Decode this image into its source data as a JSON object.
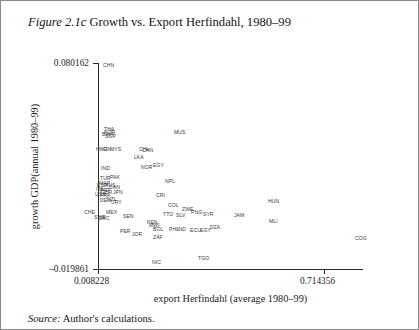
{
  "caption": {
    "figure_label": "Figure 2.1c",
    "title": "Growth vs. Export Herfindahl, 1980–99"
  },
  "source": {
    "label": "Source:",
    "text": "Author's calculations."
  },
  "chart_data": {
    "type": "scatter",
    "title": "Growth vs. Export Herfindahl, 1980–99",
    "xlabel": "export Herfindahl (average 1980–99)",
    "ylabel": "growth GDP(annual 1980–99)",
    "xlim": [
      0.008228,
      0.714356
    ],
    "ylim": [
      -0.019861,
      0.080162
    ],
    "xticks": [
      "0.008228",
      "0.714356"
    ],
    "yticks": [
      "0.080162",
      "-0.019861"
    ],
    "grid": false,
    "legend": "none",
    "point_label_field": "iso3 country code",
    "points": [
      {
        "label": "CHN",
        "x": 0.028,
        "y": 0.08
      },
      {
        "label": "THA",
        "x": 0.03,
        "y": 0.0545
      },
      {
        "label": "KOR",
        "x": 0.031,
        "y": 0.0535
      },
      {
        "label": "BWA",
        "x": 0.029,
        "y": 0.0522
      },
      {
        "label": "SGP",
        "x": 0.033,
        "y": 0.0512
      },
      {
        "label": "MUS",
        "x": 0.205,
        "y": 0.0545
      },
      {
        "label": "HKG",
        "x": 0.021,
        "y": 0.0455
      },
      {
        "label": "IDN",
        "x": 0.027,
        "y": 0.0452
      },
      {
        "label": "MYS",
        "x": 0.042,
        "y": 0.045
      },
      {
        "label": "CHL",
        "x": 0.13,
        "y": 0.0442
      },
      {
        "label": "CHN2",
        "x": 0.136,
        "y": 0.0438
      },
      {
        "label": "LKA",
        "x": 0.108,
        "y": 0.0405
      },
      {
        "label": "IND",
        "x": 0.026,
        "y": 0.0365
      },
      {
        "label": "NOR",
        "x": 0.13,
        "y": 0.0362
      },
      {
        "label": "EGY",
        "x": 0.15,
        "y": 0.0372
      },
      {
        "label": "PAK",
        "x": 0.057,
        "y": 0.0358
      },
      {
        "label": "TUR",
        "x": 0.024,
        "y": 0.034
      },
      {
        "label": "NPL",
        "x": 0.18,
        "y": 0.0318
      },
      {
        "label": "MAR",
        "x": 0.023,
        "y": 0.032
      },
      {
        "label": "AUS",
        "x": 0.036,
        "y": 0.0312
      },
      {
        "label": "ESP",
        "x": 0.02,
        "y": 0.0305
      },
      {
        "label": "CAN",
        "x": 0.041,
        "y": 0.0302
      },
      {
        "label": "ITA",
        "x": 0.019,
        "y": 0.0292
      },
      {
        "label": "PRT",
        "x": 0.022,
        "y": 0.0288
      },
      {
        "label": "GBR",
        "x": 0.026,
        "y": 0.0282
      },
      {
        "label": "JPN",
        "x": 0.05,
        "y": 0.0278
      },
      {
        "label": "USA",
        "x": 0.018,
        "y": 0.0272
      },
      {
        "label": "FRA",
        "x": 0.021,
        "y": 0.0268
      },
      {
        "label": "CRI",
        "x": 0.152,
        "y": 0.0268
      },
      {
        "label": "COL",
        "x": 0.168,
        "y": 0.0232
      },
      {
        "label": "NZL",
        "x": 0.04,
        "y": 0.0252
      },
      {
        "label": "DEU",
        "x": 0.024,
        "y": 0.0248
      },
      {
        "label": "URY",
        "x": 0.055,
        "y": 0.0238
      },
      {
        "label": "ZWE",
        "x": 0.192,
        "y": 0.0218
      },
      {
        "label": "CHE",
        "x": 0.012,
        "y": 0.0205
      },
      {
        "label": "MEX",
        "x": 0.048,
        "y": 0.0202
      },
      {
        "label": "TTO",
        "x": 0.16,
        "y": 0.0198
      },
      {
        "label": "SLV",
        "x": 0.176,
        "y": 0.0192
      },
      {
        "label": "PNG",
        "x": 0.206,
        "y": 0.0208
      },
      {
        "label": "SYR",
        "x": 0.222,
        "y": 0.02
      },
      {
        "label": "JAM",
        "x": 0.272,
        "y": 0.0192
      },
      {
        "label": "HUN",
        "x": 0.31,
        "y": 0.0262
      },
      {
        "label": "SEN",
        "x": 0.072,
        "y": 0.0192
      },
      {
        "label": "SWE",
        "x": 0.016,
        "y": 0.0188
      },
      {
        "label": "GRC",
        "x": 0.02,
        "y": 0.0185
      },
      {
        "label": "KEN",
        "x": 0.098,
        "y": 0.0162
      },
      {
        "label": "MWI",
        "x": 0.104,
        "y": 0.0172
      },
      {
        "label": "BOL",
        "x": 0.122,
        "y": 0.0152
      },
      {
        "label": "PHL",
        "x": 0.148,
        "y": 0.015
      },
      {
        "label": "IND2",
        "x": 0.158,
        "y": 0.0148
      },
      {
        "label": "ECU",
        "x": 0.186,
        "y": 0.0145
      },
      {
        "label": "DZA",
        "x": 0.214,
        "y": 0.0152
      },
      {
        "label": "MLI",
        "x": 0.312,
        "y": 0.0162
      },
      {
        "label": "PER",
        "x": 0.096,
        "y": 0.0125
      },
      {
        "label": "JOR",
        "x": 0.112,
        "y": 0.0115
      },
      {
        "label": "ZAF",
        "x": 0.142,
        "y": 0.0108
      },
      {
        "label": "COG",
        "x": 0.468,
        "y": 0.0118
      },
      {
        "label": "NIC",
        "x": 0.144,
        "y": -0.0128
      },
      {
        "label": "TGO",
        "x": 0.215,
        "y": -0.0108
      }
    ]
  },
  "plot_labels": [
    {
      "name": "CHN",
      "text": "CHN",
      "left": 102,
      "top": 62
    },
    {
      "name": "THA",
      "text": "THA",
      "left": 103,
      "top": 126
    },
    {
      "name": "KOR",
      "text": "KOR",
      "left": 103,
      "top": 129
    },
    {
      "name": "BWA",
      "text": "BWA",
      "left": 101,
      "top": 131
    },
    {
      "name": "SGP",
      "text": "SGP",
      "left": 104,
      "top": 133
    },
    {
      "name": "MUS",
      "text": "MUS",
      "left": 173,
      "top": 129
    },
    {
      "name": "HKG",
      "text": "HKG",
      "left": 95,
      "top": 146
    },
    {
      "name": "IDN",
      "text": "IDN",
      "left": 101,
      "top": 146
    },
    {
      "name": "MYS",
      "text": "MYS",
      "left": 109,
      "top": 146
    },
    {
      "name": "CHL",
      "text": "CHL",
      "left": 138,
      "top": 146
    },
    {
      "name": "CHN-b",
      "text": "CHN",
      "left": 141,
      "top": 147
    },
    {
      "name": "LKA",
      "text": "LKA",
      "left": 133,
      "top": 154
    },
    {
      "name": "IND",
      "text": "IND",
      "left": 100,
      "top": 165
    },
    {
      "name": "NOR",
      "text": "NOR",
      "left": 140,
      "top": 164
    },
    {
      "name": "EGY",
      "text": "EGY",
      "left": 152,
      "top": 162
    },
    {
      "name": "PAK",
      "text": "PAK",
      "left": 109,
      "top": 174
    },
    {
      "name": "TUR",
      "text": "TUR",
      "left": 99,
      "top": 175
    },
    {
      "name": "NPL",
      "text": "NPL",
      "left": 164,
      "top": 178
    },
    {
      "name": "MAR",
      "text": "MAR",
      "left": 98,
      "top": 180
    },
    {
      "name": "AUS",
      "text": "AUS",
      "left": 104,
      "top": 182
    },
    {
      "name": "ESP",
      "text": "ESP",
      "left": 96,
      "top": 182
    },
    {
      "name": "CAN",
      "text": "CAN",
      "left": 108,
      "top": 184
    },
    {
      "name": "ITA",
      "text": "ITA",
      "left": 95,
      "top": 186
    },
    {
      "name": "PRT",
      "text": "PRT",
      "left": 99,
      "top": 187
    },
    {
      "name": "GBR",
      "text": "GBR",
      "left": 100,
      "top": 189
    },
    {
      "name": "JPN",
      "text": "JPN",
      "left": 112,
      "top": 189
    },
    {
      "name": "USA",
      "text": "USA",
      "left": 94,
      "top": 191
    },
    {
      "name": "FRA",
      "text": "FRA",
      "left": 99,
      "top": 192
    },
    {
      "name": "CRI",
      "text": "CRI",
      "left": 155,
      "top": 192
    },
    {
      "name": "COL",
      "text": "COL",
      "left": 167,
      "top": 202
    },
    {
      "name": "NZL",
      "text": "NZL",
      "left": 106,
      "top": 196
    },
    {
      "name": "DEU",
      "text": "DEU",
      "left": 99,
      "top": 197
    },
    {
      "name": "URY",
      "text": "URY",
      "left": 110,
      "top": 199
    },
    {
      "name": "ZWE",
      "text": "ZWE",
      "left": 181,
      "top": 206
    },
    {
      "name": "CHE",
      "text": "CHE",
      "left": 83,
      "top": 209
    },
    {
      "name": "MEX",
      "text": "MEX",
      "left": 105,
      "top": 209
    },
    {
      "name": "TTO",
      "text": "TTO",
      "left": 162,
      "top": 211
    },
    {
      "name": "SLV",
      "text": "SLV",
      "left": 175,
      "top": 212
    },
    {
      "name": "PNG",
      "text": "PNG",
      "left": 190,
      "top": 209
    },
    {
      "name": "SYR",
      "text": "SYR",
      "left": 202,
      "top": 211
    },
    {
      "name": "JAM",
      "text": "JAM",
      "left": 233,
      "top": 212
    },
    {
      "name": "HUN",
      "text": "HUN",
      "left": 267,
      "top": 198
    },
    {
      "name": "SEN",
      "text": "SEN",
      "left": 122,
      "top": 213
    },
    {
      "name": "SWE",
      "text": "SWE",
      "left": 93,
      "top": 214
    },
    {
      "name": "GRC",
      "text": "GRC",
      "left": 97,
      "top": 215
    },
    {
      "name": "KEN",
      "text": "KEN",
      "left": 146,
      "top": 219
    },
    {
      "name": "MWI",
      "text": "MWI",
      "left": 148,
      "top": 222
    },
    {
      "name": "BOL",
      "text": "BOL",
      "left": 152,
      "top": 226
    },
    {
      "name": "PHL",
      "text": "PHL",
      "left": 168,
      "top": 226
    },
    {
      "name": "IND-b",
      "text": "IND",
      "left": 176,
      "top": 226
    },
    {
      "name": "ECU",
      "text": "ECU",
      "left": 189,
      "top": 227
    },
    {
      "name": "EGY-b",
      "text": "EGY",
      "left": 199,
      "top": 227
    },
    {
      "name": "DZA",
      "text": "DZA",
      "left": 209,
      "top": 224
    },
    {
      "name": "MLI",
      "text": "MLI",
      "left": 268,
      "top": 218
    },
    {
      "name": "PER",
      "text": "PER",
      "left": 119,
      "top": 228
    },
    {
      "name": "JOR",
      "text": "JOR",
      "left": 131,
      "top": 231
    },
    {
      "name": "ZAF",
      "text": "ZAF",
      "left": 152,
      "top": 234
    },
    {
      "name": "COG",
      "text": "COG",
      "left": 354,
      "top": 235
    },
    {
      "name": "NIC",
      "text": "NIC",
      "left": 151,
      "top": 259
    },
    {
      "name": "TGO",
      "text": "TGO",
      "left": 197,
      "top": 255
    }
  ],
  "axes": {
    "y_top_label": "0.080162",
    "y_bottom_label": "–19861_PLACEHOLDER",
    "y_bottom_label_real": "–0.019861",
    "x_left_label": "0.008228",
    "x_right_label": "0.714356",
    "y_title": "growth GDP(annual 1980–99)",
    "x_title": "export Herfindahl (average 1980–99)"
  }
}
